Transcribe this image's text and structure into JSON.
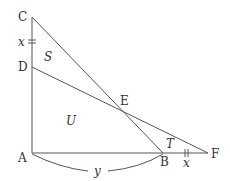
{
  "diagram": {
    "points": {
      "A": {
        "label": "A",
        "x": 32,
        "y": 153
      },
      "B": {
        "label": "B",
        "x": 163,
        "y": 153
      },
      "C": {
        "label": "C",
        "x": 32,
        "y": 17
      },
      "D": {
        "label": "D",
        "x": 32,
        "y": 67
      },
      "E": {
        "label": "E",
        "x": 121,
        "y": 109
      },
      "F": {
        "label": "F",
        "x": 208,
        "y": 153
      }
    },
    "regions": {
      "S": "S",
      "U": "U",
      "T": "T"
    },
    "measures": {
      "CD": "x",
      "BF": "x",
      "AB": "y"
    },
    "segments": [
      "AC",
      "AF",
      "CB",
      "DF"
    ]
  }
}
